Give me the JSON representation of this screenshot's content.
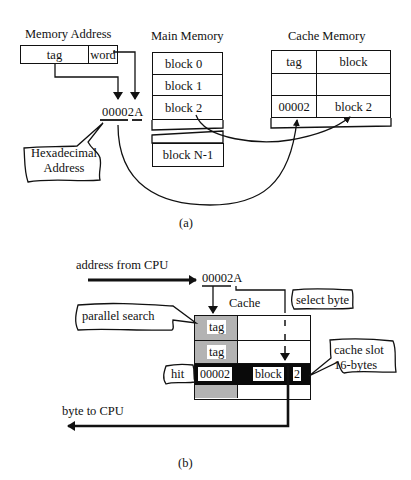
{
  "part_a": {
    "caption": "(a)",
    "memory_address": {
      "title": "Memory Address",
      "fields": [
        "tag",
        "word"
      ],
      "hex_value": "00002A",
      "callout": [
        "Hexadecimal",
        "Address"
      ]
    },
    "main_memory": {
      "title": "Main Memory",
      "blocks": [
        "block 0",
        "block 1",
        "block 2",
        "block N-1"
      ]
    },
    "cache_memory": {
      "title": "Cache Memory",
      "headers": [
        "tag",
        "block"
      ],
      "rows": [
        [
          "",
          ""
        ],
        [
          "00002",
          "block 2"
        ]
      ]
    }
  },
  "part_b": {
    "caption": "(b)",
    "address_label": "address from CPU",
    "address_value": "00002A",
    "cache_title": "Cache",
    "tag_cells": [
      "tag",
      "tag",
      "00002"
    ],
    "hit_row_block": "block",
    "hit_row_byte": "2",
    "callouts": {
      "parallel_search": "parallel search",
      "select_byte": "select byte",
      "hit": "hit",
      "cache_slot": [
        "cache slot",
        "16-bytes"
      ]
    },
    "output_label": "byte to CPU"
  },
  "colors": {
    "line": "#111111",
    "tag_gray": "#b3b3b3",
    "hit_row": "#0a0a0a",
    "background": "#ffffff"
  }
}
